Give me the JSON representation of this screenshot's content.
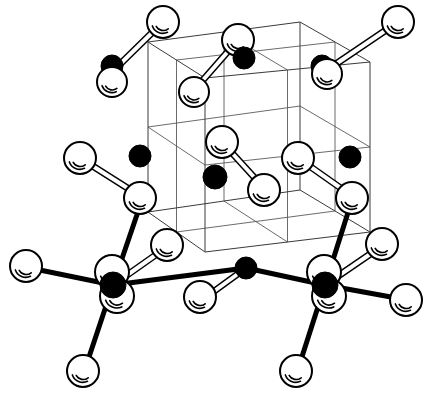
{
  "figure": {
    "kind": "ball-and-stick crystal lattice",
    "background_color": "#ffffff",
    "line_color": "#000000",
    "cell_line_color": "#3a3a3a",
    "width": 428,
    "height": 398
  },
  "legend": {
    "open_atom_label": "open sphere atom",
    "filled_atom_label": "filled sphere atom",
    "open_atom_color": "#ffffff",
    "filled_atom_color": "#000000"
  },
  "unit_cell": {
    "label": "unit cell wireframe",
    "subdivisions": 2,
    "corners": {
      "back_top_left": [
        148,
        42
      ],
      "back_top_right": [
        300,
        22
      ],
      "front_top_right": [
        370,
        62
      ],
      "front_top_left": [
        205,
        78
      ],
      "back_bottom_left": [
        148,
        212
      ],
      "back_bottom_right": [
        300,
        190
      ],
      "front_bottom_right": [
        370,
        232
      ],
      "front_bottom_left": [
        205,
        252
      ]
    }
  },
  "atoms": {
    "open": [
      {
        "id": "o1",
        "name": "atom-open-top-back-left",
        "cx": 163,
        "cy": 22,
        "r": 16
      },
      {
        "id": "o2",
        "name": "atom-open-top-left-lower",
        "cx": 112,
        "cy": 82,
        "r": 15
      },
      {
        "id": "o3",
        "name": "atom-open-top-mid",
        "cx": 238,
        "cy": 40,
        "r": 16
      },
      {
        "id": "o4",
        "name": "atom-open-top-mid-lower",
        "cx": 194,
        "cy": 92,
        "r": 15
      },
      {
        "id": "o5",
        "name": "atom-open-top-back-right",
        "cx": 398,
        "cy": 22,
        "r": 16
      },
      {
        "id": "o6",
        "name": "atom-open-top-right-lower",
        "cx": 327,
        "cy": 74,
        "r": 15
      },
      {
        "id": "o7",
        "name": "atom-open-mid-left",
        "cx": 80,
        "cy": 158,
        "r": 16
      },
      {
        "id": "o8",
        "name": "atom-open-mid-left-lower",
        "cx": 140,
        "cy": 198,
        "r": 16
      },
      {
        "id": "o9",
        "name": "atom-open-center-upper",
        "cx": 222,
        "cy": 142,
        "r": 16
      },
      {
        "id": "o10",
        "name": "atom-open-center-lower",
        "cx": 264,
        "cy": 190,
        "r": 16
      },
      {
        "id": "o11",
        "name": "atom-open-mid-right",
        "cx": 298,
        "cy": 158,
        "r": 16
      },
      {
        "id": "o12",
        "name": "atom-open-mid-right-lower",
        "cx": 352,
        "cy": 198,
        "r": 16
      },
      {
        "id": "o13",
        "name": "atom-open-front-upper-left",
        "cx": 167,
        "cy": 245,
        "r": 16
      },
      {
        "id": "o14",
        "name": "atom-open-front-upper-right",
        "cx": 382,
        "cy": 244,
        "r": 16
      },
      {
        "id": "o15",
        "name": "atom-open-left-arm",
        "cx": 26,
        "cy": 266,
        "r": 16
      },
      {
        "id": "o16",
        "name": "atom-open-left-cluster-upper",
        "cx": 112,
        "cy": 272,
        "r": 17
      },
      {
        "id": "o17",
        "name": "atom-open-left-cluster-lower",
        "cx": 117,
        "cy": 296,
        "r": 17
      },
      {
        "id": "o18",
        "name": "atom-open-left-bottom-arm",
        "cx": 83,
        "cy": 371,
        "r": 16
      },
      {
        "id": "o19",
        "name": "atom-open-mid-bottom-arm",
        "cx": 200,
        "cy": 297,
        "r": 16
      },
      {
        "id": "o20",
        "name": "atom-open-right-cluster-upper",
        "cx": 324,
        "cy": 272,
        "r": 17
      },
      {
        "id": "o21",
        "name": "atom-open-right-cluster-lower",
        "cx": 329,
        "cy": 296,
        "r": 17
      },
      {
        "id": "o22",
        "name": "atom-open-right-arm",
        "cx": 406,
        "cy": 300,
        "r": 16
      },
      {
        "id": "o23",
        "name": "atom-open-right-bottom-arm",
        "cx": 296,
        "cy": 371,
        "r": 16
      }
    ],
    "filled": [
      {
        "id": "f1",
        "name": "atom-filled-top-left",
        "cx": 112,
        "cy": 66,
        "r": 11
      },
      {
        "id": "f2",
        "name": "atom-filled-top-mid",
        "cx": 244,
        "cy": 58,
        "r": 11
      },
      {
        "id": "f3",
        "name": "atom-filled-top-right",
        "cx": 322,
        "cy": 66,
        "r": 11
      },
      {
        "id": "f4",
        "name": "atom-filled-mid-left",
        "cx": 140,
        "cy": 156,
        "r": 11
      },
      {
        "id": "f5",
        "name": "atom-filled-center",
        "cx": 215,
        "cy": 177,
        "r": 12
      },
      {
        "id": "f6",
        "name": "atom-filled-mid-right",
        "cx": 350,
        "cy": 157,
        "r": 11
      },
      {
        "id": "f7",
        "name": "atom-filled-front-mid",
        "cx": 246,
        "cy": 268,
        "r": 11
      },
      {
        "id": "f8",
        "name": "atom-filled-left-node",
        "cx": 113,
        "cy": 285,
        "r": 13
      },
      {
        "id": "f9",
        "name": "atom-filled-right-node",
        "cx": 325,
        "cy": 285,
        "r": 13
      }
    ]
  },
  "bonds": {
    "tube": [
      {
        "name": "bond-tube-top-left",
        "x1": 163,
        "y1": 22,
        "x2": 112,
        "y2": 72,
        "w": 7
      },
      {
        "name": "bond-tube-top-mid",
        "x1": 238,
        "y1": 40,
        "x2": 196,
        "y2": 88,
        "w": 7
      },
      {
        "name": "bond-tube-top-right",
        "x1": 398,
        "y1": 22,
        "x2": 324,
        "y2": 72,
        "w": 7
      },
      {
        "name": "bond-tube-mid-left",
        "x1": 80,
        "y1": 158,
        "x2": 140,
        "y2": 196,
        "w": 7
      },
      {
        "name": "bond-tube-center",
        "x1": 222,
        "y1": 142,
        "x2": 264,
        "y2": 188,
        "w": 7
      },
      {
        "name": "bond-tube-mid-right",
        "x1": 298,
        "y1": 158,
        "x2": 352,
        "y2": 196,
        "w": 7
      },
      {
        "name": "bond-tube-left-node",
        "x1": 113,
        "y1": 285,
        "x2": 167,
        "y2": 247,
        "w": 7
      },
      {
        "name": "bond-tube-right-node",
        "x1": 325,
        "y1": 285,
        "x2": 382,
        "y2": 246,
        "w": 7
      },
      {
        "name": "bond-tube-front-mid",
        "x1": 246,
        "y1": 268,
        "x2": 202,
        "y2": 300,
        "w": 7
      }
    ],
    "solid": [
      {
        "name": "bond-solid-left-up",
        "x1": 113,
        "y1": 285,
        "x2": 142,
        "y2": 200,
        "w": 5
      },
      {
        "name": "bond-solid-left-out",
        "x1": 113,
        "y1": 285,
        "x2": 30,
        "y2": 268,
        "w": 5
      },
      {
        "name": "bond-solid-left-down",
        "x1": 113,
        "y1": 285,
        "x2": 86,
        "y2": 366,
        "w": 5
      },
      {
        "name": "bond-solid-left-to-center",
        "x1": 113,
        "y1": 285,
        "x2": 246,
        "y2": 268,
        "w": 5
      },
      {
        "name": "bond-solid-right-up",
        "x1": 325,
        "y1": 285,
        "x2": 352,
        "y2": 200,
        "w": 5
      },
      {
        "name": "bond-solid-right-out",
        "x1": 325,
        "y1": 285,
        "x2": 402,
        "y2": 299,
        "w": 5
      },
      {
        "name": "bond-solid-right-down",
        "x1": 325,
        "y1": 285,
        "x2": 299,
        "y2": 366,
        "w": 5
      },
      {
        "name": "bond-solid-right-to-center",
        "x1": 325,
        "y1": 285,
        "x2": 246,
        "y2": 268,
        "w": 5
      }
    ]
  }
}
